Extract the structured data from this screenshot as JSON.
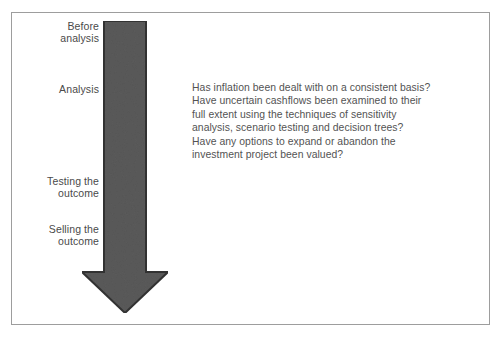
{
  "figure": {
    "frame_color": "#9d9d9d",
    "background_color": "#ffffff"
  },
  "arrow": {
    "name": "downward-process-arrow",
    "direction": "down",
    "fill_color": "#5a5a5a",
    "outline_color": "#333333"
  },
  "stages": [
    {
      "id": "before-analysis",
      "label": "Before\nanalysis"
    },
    {
      "id": "analysis",
      "label": "Analysis"
    },
    {
      "id": "testing-outcome",
      "label": "Testing the\noutcome"
    },
    {
      "id": "selling-outcome",
      "label": "Selling the\noutcome"
    }
  ],
  "questions": {
    "text_color": "#535353",
    "lines": [
      "Has inflation been dealt with on a consistent basis?",
      "Have uncertain cashflows been examined to their",
      "full extent using the techniques of sensitivity",
      "analysis, scenario testing and decision trees?",
      "Have any options to expand or abandon the",
      "investment project been valued?"
    ]
  }
}
